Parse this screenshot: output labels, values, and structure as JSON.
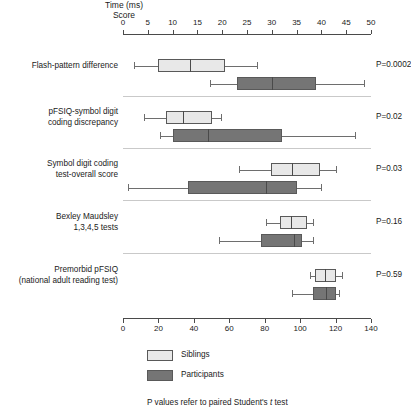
{
  "chart_data": {
    "type": "box",
    "title": "",
    "axes": [
      {
        "id": "top",
        "label": "Time (ms)",
        "position": "top",
        "min": 0,
        "max": 50,
        "tick_step": 5,
        "ticks": [
          0,
          5,
          10,
          15,
          20,
          25,
          30,
          35,
          40,
          45,
          50
        ],
        "tick_labels": [
          "0",
          "5",
          "10",
          "15",
          "20",
          "25",
          "30",
          "35",
          "40",
          "45",
          "50"
        ]
      },
      {
        "id": "bottom",
        "label": "Score",
        "position": "bottom",
        "min": 0,
        "max": 140,
        "tick_step": 20,
        "ticks": [
          0,
          20,
          40,
          60,
          80,
          100,
          120,
          140
        ],
        "tick_labels": [
          "0",
          "20",
          "40",
          "60",
          "80",
          "100",
          "120",
          "140"
        ]
      }
    ],
    "series": [
      {
        "name": "Siblings",
        "color": "#e8e8e8"
      },
      {
        "name": "Participants",
        "color": "#757575"
      }
    ],
    "groups": [
      {
        "label_lines": [
          "Flash-pattern difference"
        ],
        "p_value_label": "P=0.0002",
        "axis": "top",
        "boxes": [
          {
            "series": "Siblings",
            "whisker_low": 2.2,
            "q1": 7.0,
            "median": 13.5,
            "q3": 20.5,
            "whisker_high": 27.0
          },
          {
            "series": "Participants",
            "whisker_low": 17.5,
            "q1": 23.0,
            "median": 30.0,
            "q3": 39.0,
            "whisker_high": 48.5
          }
        ]
      },
      {
        "label_lines": [
          "pFSIQ-symbol digit",
          "coding discrepancy"
        ],
        "p_value_label": "P=0.02",
        "axis": "bottom",
        "boxes": [
          {
            "series": "Siblings",
            "whisker_low": 12.0,
            "q1": 24.0,
            "median": 34.0,
            "q3": 50.0,
            "whisker_high": 55.5
          },
          {
            "series": "Participants",
            "whisker_low": 21.0,
            "q1": 28.0,
            "median": 48.0,
            "q3": 90.0,
            "whisker_high": 131.0
          }
        ]
      },
      {
        "label_lines": [
          "Symbol digit coding",
          "test-overall score"
        ],
        "p_value_label": "P=0.03",
        "axis": "bottom",
        "boxes": [
          {
            "series": "Siblings",
            "whisker_low": 65.5,
            "q1": 83.5,
            "median": 95.5,
            "q3": 111.0,
            "whisker_high": 120.5
          },
          {
            "series": "Participants",
            "whisker_low": 2.8,
            "q1": 36.5,
            "median": 81.0,
            "q3": 98.0,
            "whisker_high": 112.0
          }
        ]
      },
      {
        "label_lines": [
          "Bexley Maudsley",
          "1,3,4,5 tests"
        ],
        "p_value_label": "P=0.16",
        "axis": "bottom",
        "boxes": [
          {
            "series": "Siblings",
            "whisker_low": 81.0,
            "q1": 88.5,
            "median": 95.0,
            "q3": 104.0,
            "whisker_high": 107.0
          },
          {
            "series": "Participants",
            "whisker_low": 54.0,
            "q1": 78.0,
            "median": 96.5,
            "q3": 101.0,
            "whisker_high": 107.5
          }
        ]
      },
      {
        "label_lines": [
          "Premorbid pFSIQ",
          "(national adult reading test)"
        ],
        "p_value_label": "P=0.59",
        "axis": "bottom",
        "boxes": [
          {
            "series": "Siblings",
            "whisker_low": 105.5,
            "q1": 108.5,
            "median": 114.0,
            "q3": 120.5,
            "whisker_high": 123.5
          },
          {
            "series": "Participants",
            "whisker_low": 95.5,
            "q1": 107.5,
            "median": 114.5,
            "q3": 120.0,
            "whisker_high": 122.0
          }
        ]
      }
    ],
    "legend": {
      "position": "bottom-left",
      "entries": [
        {
          "label": "Siblings",
          "color": "#e8e8e8"
        },
        {
          "label": "Participants",
          "color": "#757575"
        }
      ],
      "footnote_prefix": "P values refer to paired Student's ",
      "footnote_italic": "t",
      "footnote_suffix": " test"
    }
  }
}
